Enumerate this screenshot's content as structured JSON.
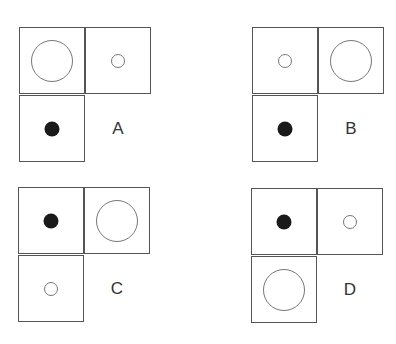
{
  "panels": [
    {
      "label": "A",
      "cells": {
        "top_left": "large",
        "top_right": "small",
        "bottom_left": "dot"
      },
      "position": {
        "left": 19,
        "top": 27
      }
    },
    {
      "label": "B",
      "cells": {
        "top_left": "small",
        "top_right": "large",
        "bottom_left": "dot"
      },
      "position": {
        "left": 252,
        "top": 27
      }
    },
    {
      "label": "C",
      "cells": {
        "top_left": "dot",
        "top_right": "large",
        "bottom_left": "small"
      },
      "position": {
        "left": 18,
        "top": 187
      }
    },
    {
      "label": "D",
      "cells": {
        "top_left": "dot",
        "top_right": "small",
        "bottom_left": "large"
      },
      "position": {
        "left": 251,
        "top": 188
      }
    }
  ],
  "shape_legend": {
    "large": "large hollow circle",
    "small": "small hollow circle",
    "dot": "small filled black circle"
  }
}
